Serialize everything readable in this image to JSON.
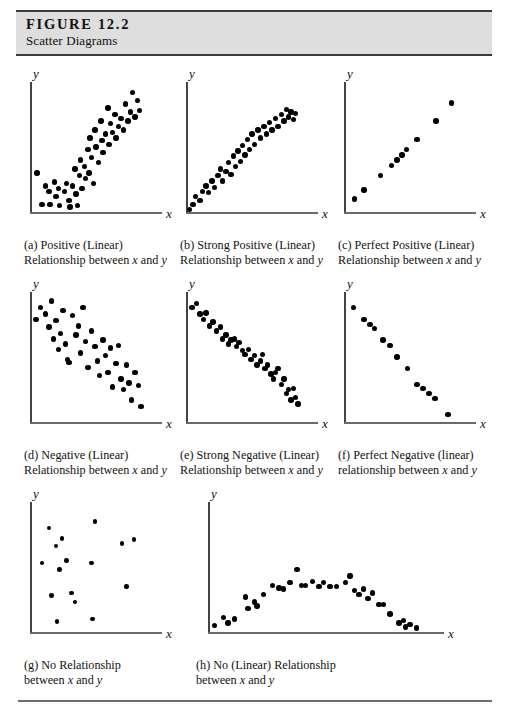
{
  "header": {
    "figure_number": "FIGURE 12.2",
    "figure_title": "Scatter Diagrams"
  },
  "axis_labels": {
    "x": "x",
    "y": "y"
  },
  "chart_data": [
    {
      "id": "a",
      "type": "scatter",
      "title": "Positive (Linear)",
      "caption_line1": "(a)  Positive (Linear)",
      "caption_line2": "Relationship between x and y",
      "xlabel": "x",
      "ylabel": "y",
      "xlim": [
        0,
        100
      ],
      "ylim": [
        0,
        100
      ],
      "grid": false,
      "points": [
        [
          6,
          30
        ],
        [
          10,
          6
        ],
        [
          13,
          20
        ],
        [
          16,
          16
        ],
        [
          17,
          6
        ],
        [
          21,
          23
        ],
        [
          22,
          12
        ],
        [
          24,
          18
        ],
        [
          25,
          5
        ],
        [
          29,
          16
        ],
        [
          31,
          22
        ],
        [
          33,
          9
        ],
        [
          34,
          4
        ],
        [
          36,
          20
        ],
        [
          38,
          33
        ],
        [
          39,
          14
        ],
        [
          40,
          5
        ],
        [
          42,
          28
        ],
        [
          43,
          40
        ],
        [
          44,
          18
        ],
        [
          46,
          35
        ],
        [
          47,
          26
        ],
        [
          49,
          48
        ],
        [
          50,
          30
        ],
        [
          51,
          57
        ],
        [
          52,
          42
        ],
        [
          54,
          22
        ],
        [
          55,
          63
        ],
        [
          56,
          50
        ],
        [
          58,
          38
        ],
        [
          60,
          70
        ],
        [
          61,
          55
        ],
        [
          62,
          46
        ],
        [
          64,
          60
        ],
        [
          66,
          80
        ],
        [
          67,
          52
        ],
        [
          68,
          68
        ],
        [
          70,
          61
        ],
        [
          72,
          75
        ],
        [
          73,
          57
        ],
        [
          75,
          66
        ],
        [
          77,
          72
        ],
        [
          79,
          63
        ],
        [
          81,
          83
        ],
        [
          83,
          70
        ],
        [
          85,
          77
        ],
        [
          87,
          92
        ],
        [
          89,
          73
        ],
        [
          91,
          86
        ],
        [
          93,
          78
        ]
      ]
    },
    {
      "id": "b",
      "type": "scatter",
      "title": "Strong Positive (Linear)",
      "caption_line1": "(b)  Strong Positive (Linear)",
      "caption_line2": "Relationship between x and y",
      "xlabel": "x",
      "ylabel": "y",
      "xlim": [
        0,
        100
      ],
      "ylim": [
        0,
        100
      ],
      "grid": false,
      "points": [
        [
          3,
          2
        ],
        [
          6,
          6
        ],
        [
          8,
          12
        ],
        [
          12,
          9
        ],
        [
          14,
          16
        ],
        [
          17,
          20
        ],
        [
          19,
          15
        ],
        [
          22,
          24
        ],
        [
          24,
          19
        ],
        [
          27,
          28
        ],
        [
          29,
          33
        ],
        [
          31,
          24
        ],
        [
          34,
          31
        ],
        [
          36,
          38
        ],
        [
          38,
          29
        ],
        [
          40,
          43
        ],
        [
          42,
          35
        ],
        [
          44,
          47
        ],
        [
          46,
          39
        ],
        [
          48,
          51
        ],
        [
          50,
          44
        ],
        [
          52,
          56
        ],
        [
          54,
          48
        ],
        [
          56,
          60
        ],
        [
          58,
          52
        ],
        [
          61,
          63
        ],
        [
          63,
          57
        ],
        [
          66,
          66
        ],
        [
          68,
          60
        ],
        [
          71,
          69
        ],
        [
          73,
          63
        ],
        [
          76,
          72
        ],
        [
          78,
          66
        ],
        [
          81,
          75
        ],
        [
          83,
          70
        ],
        [
          85,
          79
        ],
        [
          87,
          73
        ],
        [
          89,
          77
        ],
        [
          91,
          71
        ],
        [
          93,
          76
        ]
      ]
    },
    {
      "id": "c",
      "type": "scatter",
      "title": "Perfect Positive (Linear)",
      "caption_line1": "(c)  Perfect Positive (Linear)",
      "caption_line2": "Relationship between x and y",
      "xlabel": "x",
      "ylabel": "y",
      "xlim": [
        0,
        100
      ],
      "ylim": [
        0,
        100
      ],
      "grid": false,
      "points": [
        [
          9,
          10
        ],
        [
          17,
          17
        ],
        [
          31,
          28
        ],
        [
          40,
          36
        ],
        [
          45,
          40
        ],
        [
          49,
          44
        ],
        [
          53,
          48
        ],
        [
          62,
          56
        ],
        [
          78,
          70
        ],
        [
          91,
          84
        ]
      ]
    },
    {
      "id": "d",
      "type": "scatter",
      "title": "Negative (Linear)",
      "caption_line1": "(d)  Negative (Linear)",
      "caption_line2": "Relationship between x and y",
      "xlabel": "x",
      "ylabel": "y",
      "xlim": [
        0,
        100
      ],
      "ylim": [
        0,
        100
      ],
      "grid": false,
      "points": [
        [
          5,
          79
        ],
        [
          9,
          88
        ],
        [
          13,
          83
        ],
        [
          16,
          73
        ],
        [
          18,
          93
        ],
        [
          20,
          64
        ],
        [
          22,
          78
        ],
        [
          24,
          56
        ],
        [
          26,
          68
        ],
        [
          28,
          86
        ],
        [
          30,
          60
        ],
        [
          32,
          48
        ],
        [
          33,
          46
        ],
        [
          36,
          82
        ],
        [
          39,
          67
        ],
        [
          41,
          74
        ],
        [
          43,
          53
        ],
        [
          45,
          88
        ],
        [
          47,
          62
        ],
        [
          49,
          42
        ],
        [
          52,
          70
        ],
        [
          55,
          58
        ],
        [
          57,
          47
        ],
        [
          59,
          36
        ],
        [
          62,
          63
        ],
        [
          64,
          51
        ],
        [
          66,
          38
        ],
        [
          68,
          57
        ],
        [
          70,
          27
        ],
        [
          73,
          45
        ],
        [
          75,
          59
        ],
        [
          77,
          33
        ],
        [
          79,
          25
        ],
        [
          82,
          44
        ],
        [
          84,
          30
        ],
        [
          86,
          17
        ],
        [
          89,
          38
        ],
        [
          92,
          28
        ],
        [
          94,
          12
        ]
      ]
    },
    {
      "id": "e",
      "type": "scatter",
      "title": "Strong Negative (Linear)",
      "caption_line1": "(e)  Strong Negative (Linear)",
      "caption_line2": "Relationship between x and y",
      "xlabel": "x",
      "ylabel": "y",
      "xlim": [
        0,
        100
      ],
      "ylim": [
        0,
        100
      ],
      "grid": false,
      "points": [
        [
          5,
          88
        ],
        [
          9,
          91
        ],
        [
          12,
          83
        ],
        [
          15,
          79
        ],
        [
          17,
          84
        ],
        [
          20,
          74
        ],
        [
          23,
          77
        ],
        [
          26,
          70
        ],
        [
          29,
          73
        ],
        [
          31,
          64
        ],
        [
          34,
          67
        ],
        [
          36,
          60
        ],
        [
          38,
          63
        ],
        [
          41,
          64
        ],
        [
          43,
          58
        ],
        [
          45,
          61
        ],
        [
          48,
          55
        ],
        [
          50,
          52
        ],
        [
          53,
          56
        ],
        [
          55,
          48
        ],
        [
          58,
          51
        ],
        [
          60,
          44
        ],
        [
          63,
          47
        ],
        [
          65,
          52
        ],
        [
          67,
          41
        ],
        [
          69,
          44
        ],
        [
          72,
          37
        ],
        [
          74,
          33
        ],
        [
          76,
          38
        ],
        [
          78,
          41
        ],
        [
          81,
          29
        ],
        [
          83,
          33
        ],
        [
          85,
          22
        ],
        [
          87,
          25
        ],
        [
          89,
          17
        ],
        [
          91,
          26
        ],
        [
          93,
          19
        ],
        [
          95,
          14
        ]
      ]
    },
    {
      "id": "f",
      "type": "scatter",
      "title": "Perfect Negative (linear)",
      "caption_line1": "(f)  Perfect Negative (linear)",
      "caption_line2": "relationship between x and y",
      "xlabel": "x",
      "ylabel": "y",
      "xlim": [
        0,
        100
      ],
      "ylim": [
        0,
        100
      ],
      "grid": false,
      "points": [
        [
          8,
          88
        ],
        [
          17,
          79
        ],
        [
          22,
          75
        ],
        [
          26,
          72
        ],
        [
          33,
          63
        ],
        [
          39,
          59
        ],
        [
          45,
          50
        ],
        [
          54,
          41
        ],
        [
          62,
          29
        ],
        [
          67,
          26
        ],
        [
          72,
          22
        ],
        [
          77,
          18
        ],
        [
          88,
          6
        ]
      ]
    },
    {
      "id": "g",
      "type": "scatter",
      "title": "No Relationship",
      "caption_line1": "(g)  No Relationship",
      "caption_line2": "between x and y",
      "xlabel": "x",
      "ylabel": "y",
      "xlim": [
        0,
        100
      ],
      "ylim": [
        0,
        100
      ],
      "grid": false,
      "points": [
        [
          16,
          80
        ],
        [
          10,
          53
        ],
        [
          22,
          66
        ],
        [
          27,
          72
        ],
        [
          25,
          48
        ],
        [
          31,
          55
        ],
        [
          35,
          30
        ],
        [
          38,
          23
        ],
        [
          18,
          28
        ],
        [
          23,
          8
        ],
        [
          55,
          85
        ],
        [
          52,
          53
        ],
        [
          53,
          10
        ],
        [
          78,
          68
        ],
        [
          88,
          71
        ],
        [
          82,
          35
        ]
      ]
    },
    {
      "id": "h",
      "type": "scatter",
      "title": "No (Linear) Relationship",
      "caption_line1": "(h)  No (Linear) Relationship",
      "caption_line2": "between x and y",
      "xlabel": "x",
      "ylabel": "y",
      "xlim": [
        0,
        100
      ],
      "ylim": [
        0,
        100
      ],
      "grid": false,
      "points": [
        [
          3,
          5
        ],
        [
          7,
          11
        ],
        [
          9,
          7
        ],
        [
          12,
          10
        ],
        [
          17,
          27
        ],
        [
          18,
          18
        ],
        [
          21,
          23
        ],
        [
          22,
          20
        ],
        [
          25,
          29
        ],
        [
          29,
          36
        ],
        [
          32,
          34
        ],
        [
          34,
          33
        ],
        [
          37,
          38
        ],
        [
          40,
          48
        ],
        [
          42,
          36
        ],
        [
          44,
          36
        ],
        [
          47,
          39
        ],
        [
          50,
          35
        ],
        [
          52,
          38
        ],
        [
          55,
          35
        ],
        [
          58,
          35
        ],
        [
          62,
          38
        ],
        [
          64,
          43
        ],
        [
          66,
          32
        ],
        [
          68,
          29
        ],
        [
          70,
          33
        ],
        [
          72,
          26
        ],
        [
          74,
          30
        ],
        [
          77,
          21
        ],
        [
          79,
          21
        ],
        [
          82,
          14
        ],
        [
          86,
          7
        ],
        [
          88,
          9
        ],
        [
          89,
          4
        ],
        [
          91,
          6
        ],
        [
          94,
          3
        ]
      ]
    }
  ]
}
